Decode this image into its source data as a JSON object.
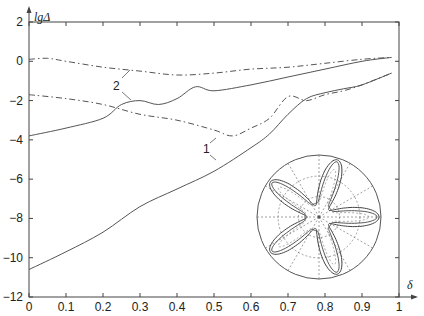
{
  "chart_data": {
    "type": "line",
    "title": "",
    "xlabel": "δ",
    "ylabel": "lgΔ",
    "xlim": [
      0,
      1
    ],
    "ylim": [
      -12,
      2
    ],
    "grid": false,
    "legend": "none",
    "x_ticks": [
      "0",
      "0.1",
      "0.2",
      "0.3",
      "0.4",
      "0.5",
      "0.6",
      "0.7",
      "0.8",
      "0.9",
      "1"
    ],
    "y_ticks": [
      "2",
      "0",
      "-2",
      "-4",
      "-6",
      "-8",
      "-10",
      "-12"
    ],
    "series": [
      {
        "name": "1 (solid)",
        "style": "solid",
        "x": [
          0,
          0.1,
          0.2,
          0.3,
          0.4,
          0.5,
          0.6,
          0.65,
          0.7,
          0.75,
          0.8,
          0.85,
          0.9,
          0.98
        ],
        "values": [
          -10.6,
          -9.7,
          -8.7,
          -7.4,
          -6.5,
          -5.6,
          -4.4,
          -3.7,
          -2.7,
          -1.9,
          -1.6,
          -1.4,
          -1.2,
          -0.6
        ]
      },
      {
        "name": "1 (dash-dot)",
        "style": "dashdot",
        "x": [
          0,
          0.1,
          0.2,
          0.3,
          0.4,
          0.5,
          0.55,
          0.6,
          0.65,
          0.7,
          0.75,
          0.8,
          0.85,
          0.9,
          0.98
        ],
        "values": [
          -1.7,
          -1.9,
          -2.2,
          -2.7,
          -3.0,
          -3.5,
          -3.8,
          -3.4,
          -2.9,
          -1.8,
          -2.0,
          -1.7,
          -1.5,
          -1.2,
          -0.6
        ]
      },
      {
        "name": "2 (solid)",
        "style": "solid",
        "x": [
          0,
          0.1,
          0.2,
          0.25,
          0.3,
          0.35,
          0.4,
          0.45,
          0.5,
          0.6,
          0.7,
          0.8,
          0.9,
          0.98
        ],
        "values": [
          -3.8,
          -3.4,
          -2.9,
          -2.2,
          -2.0,
          -2.2,
          -1.9,
          -1.3,
          -1.5,
          -1.2,
          -0.8,
          -0.4,
          0.0,
          0.2
        ]
      },
      {
        "name": "2 (dash-dot)",
        "style": "dashdot",
        "x": [
          0,
          0.05,
          0.1,
          0.2,
          0.3,
          0.4,
          0.5,
          0.6,
          0.7,
          0.8,
          0.9,
          0.98
        ],
        "values": [
          0.1,
          0.15,
          0.0,
          -0.3,
          -0.5,
          -0.7,
          -0.6,
          -0.4,
          -0.3,
          -0.1,
          0.1,
          0.2
        ]
      }
    ],
    "annotations": [
      {
        "text": "1",
        "x": 0.5,
        "y": -4.3,
        "points_to": [
          "1 (solid)",
          "1 (dash-dot)"
        ]
      },
      {
        "text": "2",
        "x": 0.24,
        "y": -1.2,
        "points_to": [
          "2 (solid)",
          "2 (dash-dot)"
        ]
      }
    ],
    "inset": {
      "type": "polar",
      "description": "five-lobed star-shaped curves in polar axes",
      "lobes": 5
    }
  },
  "labels": {
    "ylabel": "lgΔ",
    "xlabel": "δ",
    "ann1": "1",
    "ann2": "2"
  }
}
